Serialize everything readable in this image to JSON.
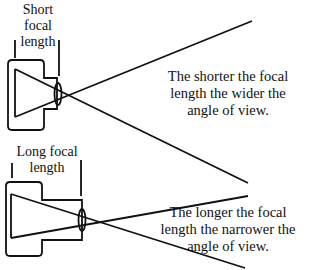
{
  "short": {
    "label_lines": [
      "Short",
      "focal",
      "length"
    ],
    "caption_lines": [
      "The shorter the focal",
      "length the wider the",
      "angle of view."
    ]
  },
  "long": {
    "label_lines": [
      "Long focal",
      "length"
    ],
    "caption_lines": [
      "The longer the focal",
      "length the narrower the",
      "angle of view."
    ]
  },
  "colors": {
    "line": "#111111",
    "background": "#ffffff"
  }
}
